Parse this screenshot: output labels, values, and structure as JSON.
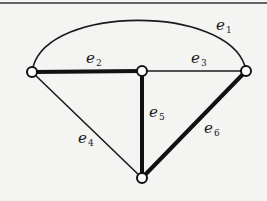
{
  "diagram": {
    "type": "graph",
    "colors": {
      "background": "#f4f4f2",
      "edge": "#111111",
      "node_fill": "#ffffff"
    },
    "nodes": [
      {
        "id": "v1",
        "position": "left",
        "x": 32,
        "y": 72
      },
      {
        "id": "v2",
        "position": "center",
        "x": 142,
        "y": 71
      },
      {
        "id": "v3",
        "position": "right",
        "x": 246,
        "y": 71
      },
      {
        "id": "v4",
        "position": "bottom",
        "x": 142,
        "y": 178
      }
    ],
    "edges": [
      {
        "label": "e",
        "index": "1",
        "from": "v1",
        "to": "v3",
        "style": "thin",
        "shape": "arc"
      },
      {
        "label": "e",
        "index": "2",
        "from": "v1",
        "to": "v2",
        "style": "thick",
        "shape": "line"
      },
      {
        "label": "e",
        "index": "3",
        "from": "v2",
        "to": "v3",
        "style": "thin",
        "shape": "line"
      },
      {
        "label": "e",
        "index": "4",
        "from": "v1",
        "to": "v4",
        "style": "thin",
        "shape": "line"
      },
      {
        "label": "e",
        "index": "5",
        "from": "v2",
        "to": "v4",
        "style": "thick",
        "shape": "line"
      },
      {
        "label": "e",
        "index": "6",
        "from": "v3",
        "to": "v4",
        "style": "thick",
        "shape": "line"
      }
    ]
  }
}
